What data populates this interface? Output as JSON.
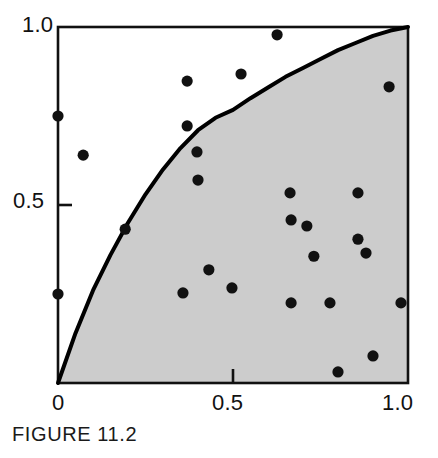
{
  "figure": {
    "caption": "FIGURE 11.2",
    "axis_color": "#111111",
    "shade_color": "#cccccc",
    "point_color": "#111111",
    "curve_color": "#000000",
    "background": "#ffffff"
  },
  "axes": {
    "x_ticks": [
      {
        "value": 0,
        "label": "0"
      },
      {
        "value": 0.5,
        "label": "0.5"
      },
      {
        "value": 1,
        "label": "1.0"
      }
    ],
    "y_ticks": [
      {
        "value": 0.5,
        "label": "0.5"
      },
      {
        "value": 1,
        "label": "1.0"
      }
    ]
  },
  "chart_data": {
    "type": "scatter",
    "title": "FIGURE 11.2",
    "xlabel": "",
    "ylabel": "",
    "xlim": [
      0,
      1
    ],
    "ylim": [
      0,
      1
    ],
    "grid": false,
    "legend": "none",
    "annotations": [
      "Shaded region lies below the curve (acceptance region)",
      "Unshaded region lies above the curve (rejection region)"
    ],
    "curve": {
      "name": "boundary curve",
      "description": "monotone increasing concave curve from (0,0) to (1,1)",
      "x": [
        0.0,
        0.05,
        0.1,
        0.15,
        0.2,
        0.25,
        0.3,
        0.35,
        0.4,
        0.45,
        0.5,
        0.55,
        0.6,
        0.65,
        0.7,
        0.75,
        0.8,
        0.85,
        0.9,
        0.95,
        1.0
      ],
      "y": [
        0.0,
        0.14,
        0.26,
        0.36,
        0.45,
        0.53,
        0.6,
        0.66,
        0.71,
        0.745,
        0.767,
        0.8,
        0.83,
        0.86,
        0.885,
        0.91,
        0.935,
        0.955,
        0.975,
        0.99,
        1.0
      ]
    },
    "points": [
      {
        "x": 0.0,
        "y": 0.75,
        "region": "above"
      },
      {
        "x": 0.0,
        "y": 0.25,
        "region": "above"
      },
      {
        "x": 0.072,
        "y": 0.64,
        "region": "above"
      },
      {
        "x": 0.192,
        "y": 0.432,
        "region": "above"
      },
      {
        "x": 0.369,
        "y": 0.848,
        "region": "above"
      },
      {
        "x": 0.369,
        "y": 0.722,
        "region": "above"
      },
      {
        "x": 0.397,
        "y": 0.649,
        "region": "above"
      },
      {
        "x": 0.4,
        "y": 0.57,
        "region": "above"
      },
      {
        "x": 0.523,
        "y": 0.868,
        "region": "above"
      },
      {
        "x": 0.626,
        "y": 0.978,
        "region": "above"
      },
      {
        "x": 0.357,
        "y": 0.253,
        "region": "below"
      },
      {
        "x": 0.431,
        "y": 0.318,
        "region": "below"
      },
      {
        "x": 0.497,
        "y": 0.267,
        "region": "below"
      },
      {
        "x": 0.663,
        "y": 0.534,
        "region": "below"
      },
      {
        "x": 0.666,
        "y": 0.225,
        "region": "below"
      },
      {
        "x": 0.666,
        "y": 0.458,
        "region": "below"
      },
      {
        "x": 0.711,
        "y": 0.441,
        "region": "below"
      },
      {
        "x": 0.731,
        "y": 0.356,
        "region": "below"
      },
      {
        "x": 0.777,
        "y": 0.225,
        "region": "below"
      },
      {
        "x": 0.8,
        "y": 0.031,
        "region": "below"
      },
      {
        "x": 0.857,
        "y": 0.534,
        "region": "below"
      },
      {
        "x": 0.857,
        "y": 0.404,
        "region": "below"
      },
      {
        "x": 0.88,
        "y": 0.365,
        "region": "below"
      },
      {
        "x": 0.9,
        "y": 0.076,
        "region": "below"
      },
      {
        "x": 0.946,
        "y": 0.832,
        "region": "below"
      },
      {
        "x": 0.98,
        "y": 0.225,
        "region": "below"
      }
    ]
  }
}
